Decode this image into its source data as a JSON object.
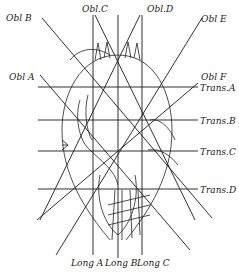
{
  "diagram": {
    "type": "grid-overlay-specimen-drawing",
    "labels": {
      "obl_a": "Obl A",
      "obl_b": "Obl B",
      "obl_c": "Obl.C",
      "obl_d": "Obl.D",
      "obl_e": "Obl E",
      "obl_f": "Obl F",
      "trans_a": "Trans.A",
      "trans_b": "Trans.B",
      "trans_c": "Trans.C",
      "trans_d": "Trans.D",
      "long_a": "Long A",
      "long_b": "Long B",
      "long_c": "Long C"
    },
    "colors": {
      "ink": "#1a1a1a",
      "background": "#ffffff"
    }
  }
}
